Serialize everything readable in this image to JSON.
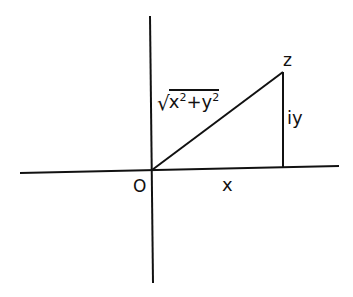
{
  "diagram": {
    "labels": {
      "origin": "O",
      "real_leg": "x",
      "imag_leg": "iy",
      "point": "z",
      "hypotenuse": {
        "radical": "√",
        "x_base": "x",
        "x_exp": "2",
        "plus": "+",
        "y_base": "y",
        "y_exp": "2"
      }
    },
    "geometry": {
      "origin": [
        152,
        170
      ],
      "point_z": [
        283,
        72
      ],
      "foot": [
        283,
        167
      ],
      "x_axis": [
        [
          20,
          173
        ],
        [
          339,
          166
        ]
      ],
      "y_axis": [
        [
          150,
          16
        ],
        [
          153,
          283
        ]
      ]
    },
    "colors": {
      "line": "#111111",
      "background": "#ffffff"
    }
  }
}
